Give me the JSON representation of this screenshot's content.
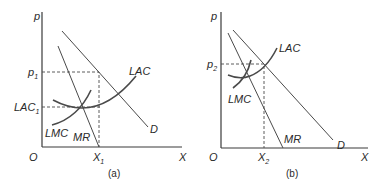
{
  "panels": [
    {
      "caption": "(a)",
      "axes": {
        "y_label": "p",
        "x_label": "X",
        "origin_label": "O"
      },
      "price_label": {
        "main": "p",
        "sub": "1"
      },
      "cost_label": {
        "main": "LAC",
        "sub": "1"
      },
      "quantity_label": {
        "main": "X",
        "sub": "1"
      },
      "curves": {
        "demand": "D",
        "marginal_revenue": "MR",
        "average_cost": "LAC",
        "marginal_cost": "LMC"
      }
    },
    {
      "caption": "(b)",
      "axes": {
        "y_label": "p",
        "x_label": "X",
        "origin_label": "O"
      },
      "price_label": {
        "main": "p",
        "sub": "2"
      },
      "quantity_label": {
        "main": "X",
        "sub": "2"
      },
      "curves": {
        "demand": "D",
        "marginal_revenue": "MR",
        "average_cost": "LAC",
        "marginal_cost": "LMC"
      }
    }
  ],
  "colors": {
    "line": "#4a4a4a",
    "text": "#2a2a2a",
    "background": "#ffffff"
  }
}
